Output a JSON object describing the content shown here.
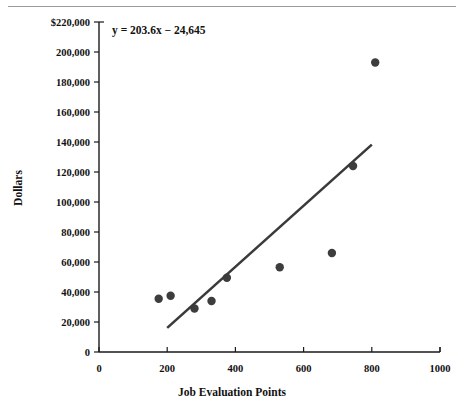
{
  "figure": {
    "top_rule": true,
    "equation_annotation": "y = 203.6x − 24,645"
  },
  "chart_data": {
    "type": "scatter",
    "title": "",
    "xlabel": "Job Evaluation Points",
    "ylabel": "Dollars",
    "xlim": [
      0,
      1000
    ],
    "ylim": [
      0,
      220000
    ],
    "grid": false,
    "legend": null,
    "xticks": [
      0,
      200,
      400,
      600,
      800,
      1000
    ],
    "xtick_labels": [
      "0",
      "200",
      "400",
      "600",
      "800",
      "1000"
    ],
    "yticks": [
      0,
      20000,
      40000,
      60000,
      80000,
      100000,
      120000,
      140000,
      160000,
      180000,
      200000,
      220000
    ],
    "ytick_labels": [
      "0",
      "20,000",
      "40,000",
      "60,000",
      "80,000",
      "100,000",
      "120,000",
      "140,000",
      "160,000",
      "180,000",
      "200,000",
      "$220,000"
    ],
    "points": [
      {
        "x": 175,
        "y": 35500
      },
      {
        "x": 210,
        "y": 37500
      },
      {
        "x": 280,
        "y": 29000
      },
      {
        "x": 330,
        "y": 34000
      },
      {
        "x": 375,
        "y": 49500
      },
      {
        "x": 530,
        "y": 56500
      },
      {
        "x": 683,
        "y": 66000
      },
      {
        "x": 745,
        "y": 124000
      },
      {
        "x": 810,
        "y": 193000
      }
    ],
    "trendline": {
      "equation": "y = 203.6x − 24,645",
      "slope": 203.6,
      "intercept": -24645,
      "x_start": 200,
      "x_end": 800,
      "y_start": 16075,
      "y_end": 138235
    }
  },
  "colors": {
    "point": "#3d3d3d",
    "trendline": "#3a3a3a",
    "axis": "#1a1a1a",
    "rule": "#9a9a9a",
    "background": "#ffffff"
  }
}
